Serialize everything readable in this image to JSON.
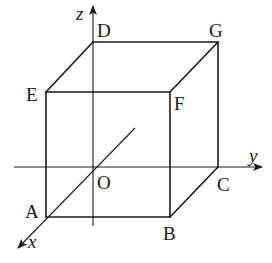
{
  "diagram": {
    "type": "3d-cube-coordinate-system",
    "axes": {
      "x": {
        "label": "x"
      },
      "y": {
        "label": "y"
      },
      "z": {
        "label": "z"
      }
    },
    "origin": {
      "label": "O"
    },
    "vertices": {
      "A": {
        "label": "A"
      },
      "B": {
        "label": "B"
      },
      "C": {
        "label": "C"
      },
      "D": {
        "label": "D"
      },
      "E": {
        "label": "E"
      },
      "F": {
        "label": "F"
      },
      "G": {
        "label": "G"
      }
    },
    "colors": {
      "line": "#1a1a1a",
      "background": "#ffffff"
    }
  }
}
